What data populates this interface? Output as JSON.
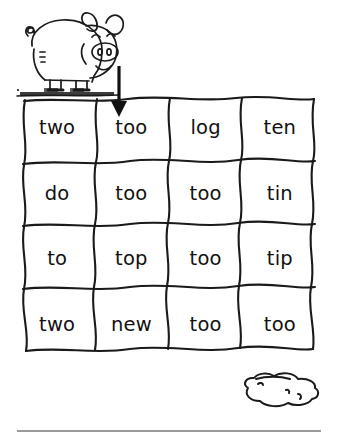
{
  "page": {
    "background_color": "#ffffff",
    "width": 338,
    "height": 440
  },
  "illustration": {
    "pig": {
      "name": "pig-illustration",
      "description": "cartoon pig standing on ground",
      "parts": [
        "curly-tail",
        "body",
        "ear-left",
        "ear-right",
        "eye-left",
        "eye-right",
        "snout",
        "nostril-left",
        "nostril-right",
        "mouth",
        "front-legs",
        "hind-legs",
        "ground-strip"
      ],
      "line_color": "#1a1a1a"
    },
    "mud_puddle": {
      "name": "mud-puddle",
      "description": "mud puddle outline",
      "line_color": "#1a1a1a"
    }
  },
  "arrow": {
    "name": "down-arrow",
    "direction": "down",
    "points_to_cell": "r1c2",
    "points_to_word": "too",
    "color": "#111111"
  },
  "grid": {
    "rows": 4,
    "columns": 4,
    "border_style": "hand-drawn-wavy",
    "line_color": "#1a1a1a",
    "target_word": "too",
    "cells": [
      [
        {
          "word": "two",
          "id": "r1c1"
        },
        {
          "word": "too",
          "id": "r1c2"
        },
        {
          "word": "log",
          "id": "r1c3"
        },
        {
          "word": "ten",
          "id": "r1c4"
        }
      ],
      [
        {
          "word": "do",
          "id": "r2c1"
        },
        {
          "word": "too",
          "id": "r2c2"
        },
        {
          "word": "too",
          "id": "r2c3"
        },
        {
          "word": "tin",
          "id": "r2c4"
        }
      ],
      [
        {
          "word": "to",
          "id": "r3c1"
        },
        {
          "word": "top",
          "id": "r3c2"
        },
        {
          "word": "too",
          "id": "r3c3"
        },
        {
          "word": "tip",
          "id": "r3c4"
        }
      ],
      [
        {
          "word": "two",
          "id": "r4c1"
        },
        {
          "word": "new",
          "id": "r4c2"
        },
        {
          "word": "too",
          "id": "r4c3"
        },
        {
          "word": "too",
          "id": "r4c4"
        }
      ]
    ]
  },
  "footer": {
    "rule_color": "#9a9a9a"
  }
}
